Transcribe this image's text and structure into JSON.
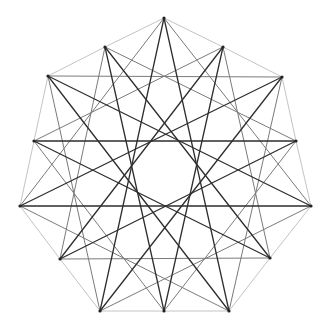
{
  "diagram": {
    "title": "",
    "vertices": [
      [
        164,
        18
      ],
      [
        282,
        77
      ],
      [
        311,
        206
      ],
      [
        229,
        311
      ],
      [
        100,
        311
      ],
      [
        20,
        206
      ],
      [
        48,
        76
      ]
    ],
    "midpoints": [
      [
        223,
        47
      ],
      [
        296,
        141
      ],
      [
        270,
        258
      ],
      [
        164,
        311
      ],
      [
        60,
        259
      ],
      [
        34,
        141
      ],
      [
        105,
        47
      ]
    ],
    "styles": {
      "outline": {
        "color": "#c4c4c4",
        "width": 1
      },
      "star2": {
        "color": "#7a7a7a",
        "width": 1
      },
      "star3": {
        "color": "#2e2e2e",
        "width": 1.3
      },
      "point": {
        "color": "#222222",
        "radius": 1.6
      }
    }
  }
}
